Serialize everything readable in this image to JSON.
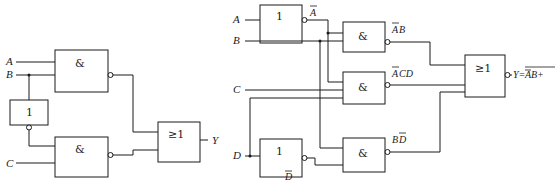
{
  "left_circuit": {
    "inputs": {
      "a": "A",
      "b": "B",
      "c": "C"
    },
    "output": "Y",
    "gates": {
      "top_and": "&",
      "not": "1",
      "bottom_and": "&",
      "or": "≥1"
    }
  },
  "right_circuit": {
    "inputs": {
      "a": "A",
      "b": "B",
      "c": "C",
      "d": "D"
    },
    "gates": {
      "not_a": "1",
      "not_d": "1",
      "and_ab": "&",
      "and_acd": "&",
      "and_bd": "&",
      "or": "≥1"
    },
    "signal_labels": {
      "not_a_out_bar": "A",
      "not_d_out_bar": "D",
      "ab_bar_part": "A",
      "ab_rest": "B",
      "acd_bar_part": "A",
      "acd_rest": "CD",
      "bd_first": "B",
      "bd_bar_part": "D"
    },
    "output_expression": {
      "prefix": "Y=",
      "term1_bar": "A",
      "term1_rest": "B",
      "plus1": "+",
      "term2_bar": "A",
      "term2_rest": "CD",
      "plus2": "+",
      "term3_first": "B",
      "term3_bar": "D"
    }
  }
}
